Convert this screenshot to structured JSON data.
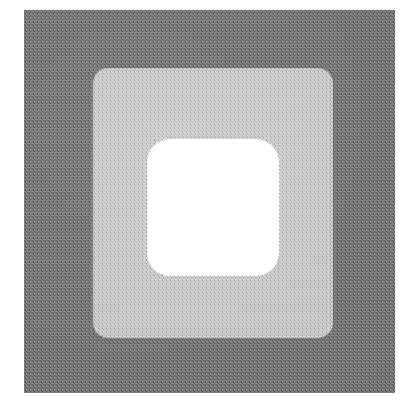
{
  "figure": {
    "caption": "",
    "background_color": "#ffffff",
    "canvas": {
      "width": 416,
      "height": 413
    },
    "regions": [
      {
        "name": "outer-dark-square",
        "label": "Outer dark grey square",
        "fill_color": "#6e6e6e",
        "tone": "dark grey halftone",
        "x": 24,
        "y": 10,
        "width": 371,
        "height": 383,
        "corner_radius": 0
      },
      {
        "name": "middle-light-square",
        "label": "Middle light grey rounded square",
        "fill_color": "#c9c9c9",
        "tone": "light grey halftone",
        "x": 93,
        "y": 68,
        "width": 240,
        "height": 270,
        "corner_radius": 15
      },
      {
        "name": "inner-white-square",
        "label": "Inner white rounded square",
        "fill_color": "#ffffff",
        "tone": "white",
        "x": 147,
        "y": 139,
        "width": 132,
        "height": 137,
        "corner_radius": 23
      }
    ]
  }
}
